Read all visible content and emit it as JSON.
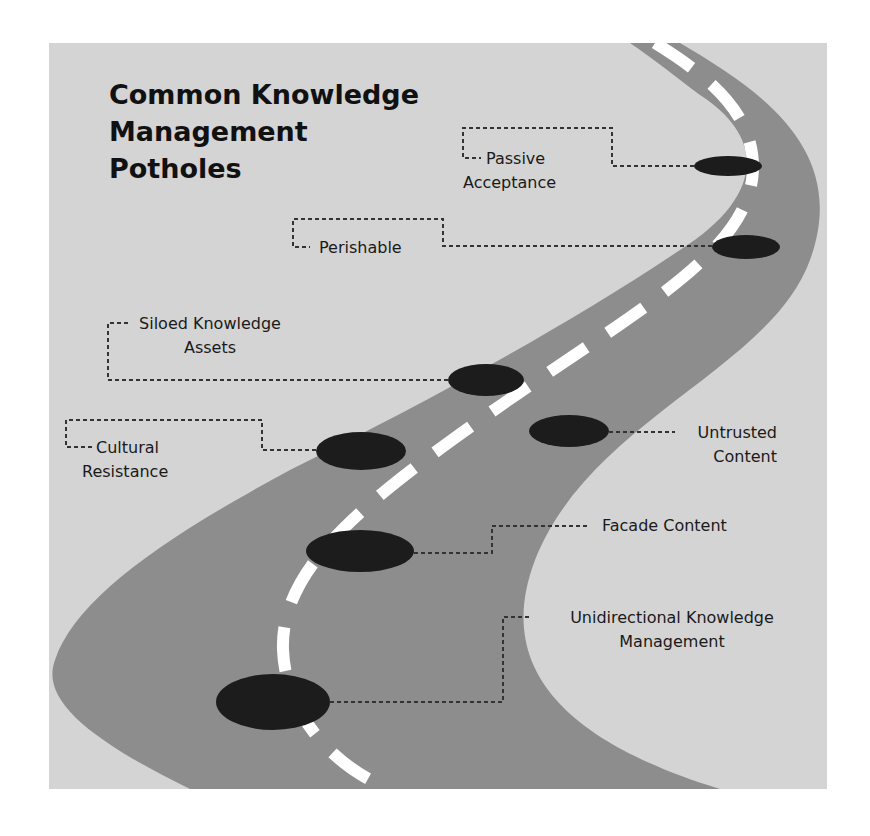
{
  "diagram": {
    "title_lines": [
      "Common Knowledge",
      "Management",
      "Potholes"
    ],
    "colors": {
      "page_background": "#ffffff",
      "panel_background": "#d4d4d4",
      "road": "#8d8d8d",
      "lane_dashes": "#ffffff",
      "potholes": "#1c1c1c",
      "leader_lines": "#333333",
      "text": "#1a1a1a"
    },
    "potholes": [
      {
        "id": "passive-acceptance",
        "label_lines": [
          "Passive",
          "Acceptance"
        ],
        "side": "left"
      },
      {
        "id": "perishable",
        "label_lines": [
          "Perishable"
        ],
        "side": "left"
      },
      {
        "id": "siloed-knowledge-assets",
        "label_lines": [
          "Siloed Knowledge",
          "Assets"
        ],
        "side": "left"
      },
      {
        "id": "cultural-resistance",
        "label_lines": [
          "Cultural",
          "Resistance"
        ],
        "side": "left"
      },
      {
        "id": "untrusted-content",
        "label_lines": [
          "Untrusted",
          "Content"
        ],
        "side": "right"
      },
      {
        "id": "facade-content",
        "label_lines": [
          "Facade Content"
        ],
        "side": "right"
      },
      {
        "id": "unidirectional-knowledge-management",
        "label_lines": [
          "Unidirectional Knowledge",
          "Management"
        ],
        "side": "right"
      }
    ]
  }
}
